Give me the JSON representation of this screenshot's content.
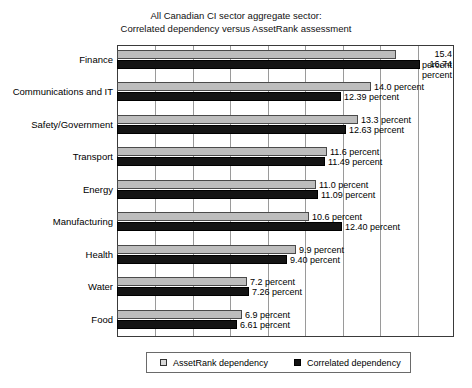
{
  "chart_data": {
    "type": "bar",
    "orientation": "horizontal",
    "title": "All Canadian CI sector aggregate sector:",
    "subtitle": "Correlated dependency versus AssetRank assessment",
    "xlabel": "",
    "ylabel": "",
    "xlim": [
      0,
      18.6
    ],
    "grid": true,
    "gridline_count": 9,
    "legend_position": "bottom",
    "categories": [
      "Finance",
      "Communications and IT",
      "Safety/Government",
      "Transport",
      "Energy",
      "Manufacturing",
      "Health",
      "Water",
      "Food"
    ],
    "series": [
      {
        "name": "AssetRank dependency",
        "color": "#bdbdbd",
        "values": [
          15.4,
          14.0,
          13.3,
          11.6,
          11.0,
          10.6,
          9.9,
          7.2,
          6.9
        ],
        "labels": [
          "15.4 percent",
          "14.0 percent",
          "13.3 percent",
          "11.6 percent",
          "11.0 percent",
          "10.6 percent",
          "9.9 percent",
          "7.2 percent",
          "6.9 percent"
        ]
      },
      {
        "name": "Correlated dependency",
        "color": "#141414",
        "values": [
          16.74,
          12.39,
          12.63,
          11.49,
          11.09,
          12.4,
          9.4,
          7.26,
          6.61
        ],
        "labels": [
          "16.74 percent",
          "12.39 percent",
          "12.63 percent",
          "11.49 percent",
          "11.09 percent",
          "12.40 percent",
          "9.40 percent",
          "7.26 percent",
          "6.61 percent"
        ]
      }
    ]
  },
  "legend": {
    "items": [
      {
        "label": "AssetRank dependency",
        "marker": "square-light"
      },
      {
        "label": "Correlated dependency",
        "marker": "square-dark"
      }
    ]
  }
}
